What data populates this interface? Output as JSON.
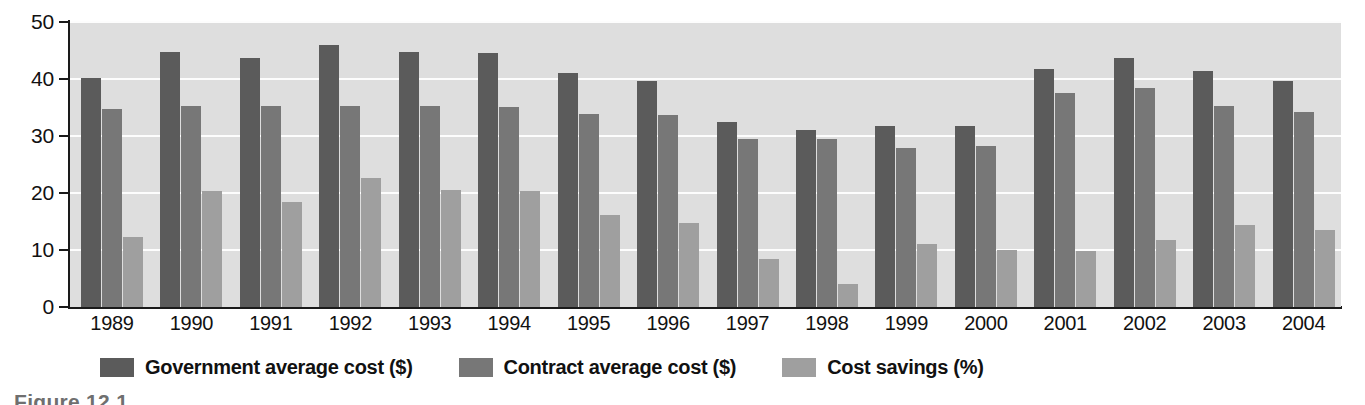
{
  "figure": {
    "caption_partial": "Figure 12.1",
    "background_color": "#ffffff",
    "plot_background_color": "#dedede",
    "gridline_color": "#fdfdfd",
    "axis_color": "#1a1a1a"
  },
  "legend": {
    "position": "below-axis",
    "items": [
      {
        "label": "Government average cost ($)",
        "color": "#5b5b5b",
        "swatch_name": "legend-swatch-government"
      },
      {
        "label": "Contract average cost ($)",
        "color": "#777777",
        "swatch_name": "legend-swatch-contract"
      },
      {
        "label": "Cost savings (%)",
        "color": "#9f9f9f",
        "swatch_name": "legend-swatch-savings"
      }
    ]
  },
  "chart_data": {
    "type": "bar",
    "title": "",
    "subtitle": "",
    "xlabel": "",
    "ylabel": "",
    "ylim": [
      0,
      50
    ],
    "yticks": [
      0,
      10,
      20,
      30,
      40,
      50
    ],
    "ytick_labels": [
      "0",
      "10",
      "20",
      "30",
      "40",
      "50"
    ],
    "grid": true,
    "grid_axis": "y",
    "legend_position": "bottom",
    "categories": [
      "1989",
      "1990",
      "1991",
      "1992",
      "1993",
      "1994",
      "1995",
      "1996",
      "1997",
      "1998",
      "1999",
      "2000",
      "2001",
      "2002",
      "2003",
      "2004"
    ],
    "series": [
      {
        "name": "Government average cost ($)",
        "color": "#5b5b5b",
        "values": [
          40.2,
          44.8,
          43.7,
          46.0,
          44.7,
          44.5,
          41.0,
          39.7,
          32.4,
          31.0,
          31.8,
          31.7,
          41.8,
          43.7,
          41.4,
          39.6
        ]
      },
      {
        "name": "Contract average cost ($)",
        "color": "#777777",
        "values": [
          34.8,
          35.3,
          35.3,
          35.3,
          35.2,
          35.1,
          33.8,
          33.7,
          29.5,
          29.4,
          27.9,
          28.3,
          37.6,
          38.4,
          35.2,
          34.2
        ]
      },
      {
        "name": "Cost savings (%)",
        "color": "#9f9f9f",
        "values": [
          12.2,
          20.3,
          18.4,
          22.7,
          20.6,
          20.4,
          16.2,
          14.8,
          8.5,
          4.0,
          11.0,
          10.0,
          9.9,
          11.8,
          14.4,
          13.5
        ]
      }
    ]
  }
}
